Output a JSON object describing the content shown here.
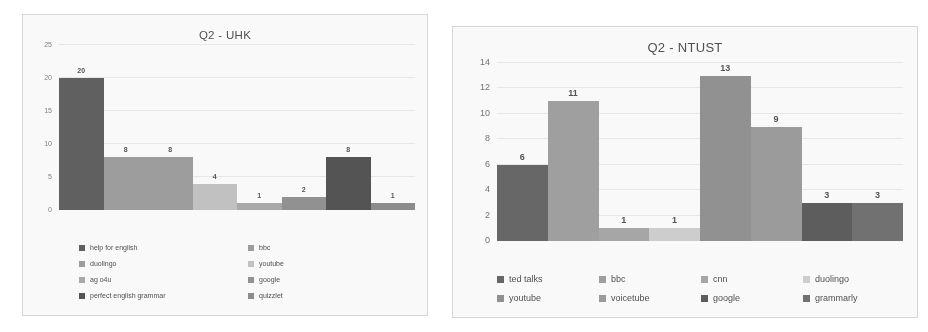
{
  "chart_data": [
    {
      "type": "bar",
      "title": "Q2 - UHK",
      "xlabel": "",
      "ylabel": "",
      "ylim": [
        0,
        25
      ],
      "yticks": [
        0,
        5,
        10,
        15,
        20,
        25
      ],
      "grid": true,
      "legend_position": "bottom",
      "categories": [
        "help for english",
        "bbc",
        "duolingo",
        "youtube",
        "ag o4u",
        "google",
        "perfect english grammar",
        "quizzlet"
      ],
      "values": [
        20,
        8,
        8,
        4,
        1,
        2,
        8,
        1
      ],
      "colors": [
        "#5c5c5c",
        "#9c9c9c",
        "#9c9c9c",
        "#c2c2c2",
        "#a8a8a8",
        "#8f8f8f",
        "#4f4f4f",
        "#8a8a8a"
      ],
      "legend": [
        {
          "label": "help for english",
          "color": "#5c5c5c"
        },
        {
          "label": "bbc",
          "color": "#9c9c9c"
        },
        {
          "label": "duolingo",
          "color": "#9c9c9c"
        },
        {
          "label": "youtube",
          "color": "#c2c2c2"
        },
        {
          "label": "ag o4u",
          "color": "#a8a8a8"
        },
        {
          "label": "google",
          "color": "#8f8f8f"
        },
        {
          "label": "perfect english grammar",
          "color": "#4f4f4f"
        },
        {
          "label": "quizzlet",
          "color": "#8a8a8a"
        }
      ]
    },
    {
      "type": "bar",
      "title": "Q2 - NTUST",
      "xlabel": "",
      "ylabel": "",
      "ylim": [
        0,
        14
      ],
      "yticks": [
        0,
        2,
        4,
        6,
        8,
        10,
        12,
        14
      ],
      "grid": true,
      "legend_position": "bottom",
      "categories": [
        "ted talks",
        "bbc",
        "cnn",
        "duolingo",
        "youtube",
        "voicetube",
        "google",
        "grammarly"
      ],
      "values": [
        6,
        11,
        1,
        1,
        13,
        9,
        3,
        3
      ],
      "colors": [
        "#636363",
        "#9e9e9e",
        "#a5a5a5",
        "#cfcfcf",
        "#8f8f8f",
        "#9a9a9a",
        "#585858",
        "#6e6e6e"
      ],
      "legend": [
        {
          "label": "ted talks",
          "color": "#636363"
        },
        {
          "label": "bbc",
          "color": "#9e9e9e"
        },
        {
          "label": "cnn",
          "color": "#a5a5a5"
        },
        {
          "label": "duolingo",
          "color": "#cfcfcf"
        },
        {
          "label": "youtube",
          "color": "#8f8f8f"
        },
        {
          "label": "voicetube",
          "color": "#9a9a9a"
        },
        {
          "label": "google",
          "color": "#585858"
        },
        {
          "label": "grammarly",
          "color": "#6e6e6e"
        }
      ]
    }
  ]
}
